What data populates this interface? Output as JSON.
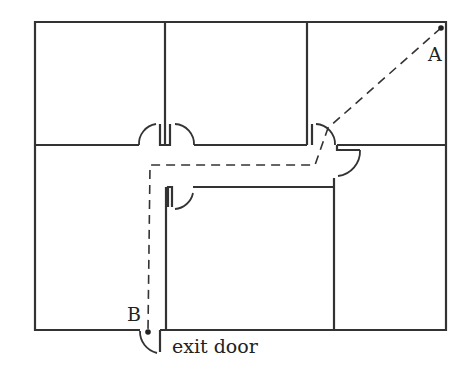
{
  "diagram": {
    "type": "floor-plan",
    "labels": {
      "point_a": "A",
      "point_b": "B",
      "exit": "exit door"
    },
    "colors": {
      "wall": "#333333",
      "path": "#333333",
      "background": "#ffffff"
    }
  }
}
